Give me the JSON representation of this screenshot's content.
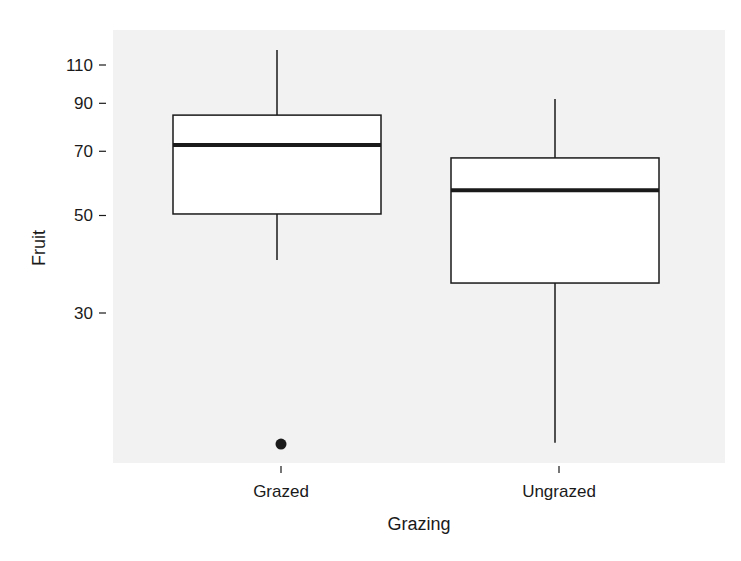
{
  "chart_data": {
    "type": "boxplot",
    "title": "",
    "xlabel": "Grazing",
    "ylabel": "Fruit",
    "y_scale": "log",
    "y_ticks": [
      30,
      50,
      70,
      90,
      110
    ],
    "ylim": [
      14,
      125
    ],
    "grid": false,
    "legend": null,
    "categories": [
      "Grazed",
      "Ungrazed"
    ],
    "series": [
      {
        "name": "Grazed",
        "whisker_low": 39.6,
        "q1": 50.4,
        "median": 72.3,
        "q3": 84.6,
        "whisker_high": 119,
        "outliers": [
          15.1
        ]
      },
      {
        "name": "Ungrazed",
        "whisker_low": 15.2,
        "q1": 35.1,
        "median": 57.1,
        "q3": 67.6,
        "whisker_high": 92,
        "outliers": []
      }
    ]
  },
  "style": {
    "panel_background": "#f2f2f2",
    "box_fill": "#ffffff",
    "line_color": "#1a1a1a"
  }
}
